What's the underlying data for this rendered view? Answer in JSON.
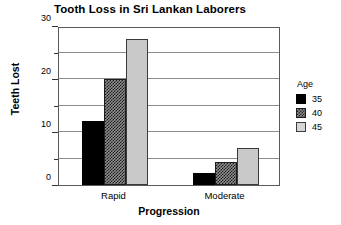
{
  "chart_data": {
    "type": "bar",
    "title": "Tooth Loss in Sri Lankan Laborers",
    "xlabel": "Progression",
    "ylabel": "Teeth Lost",
    "categories": [
      "Rapid",
      "Moderate"
    ],
    "series": [
      {
        "name": "35",
        "values": [
          12,
          2.2
        ],
        "fill": "fill-black",
        "color": "#000000"
      },
      {
        "name": "40",
        "values": [
          20,
          4.3
        ],
        "fill": "fill-hatch",
        "color": "#8f8f8f"
      },
      {
        "name": "45",
        "values": [
          27.5,
          7.0
        ],
        "fill": "fill-lightgray",
        "color": "#c9c9c9"
      }
    ],
    "ylim": [
      0,
      30
    ],
    "yticks": [
      0,
      10,
      20,
      30
    ],
    "ytick_labels": [
      "0",
      "10",
      "20",
      "30"
    ],
    "yminor": [
      5,
      15,
      25
    ],
    "gridlines": [
      5,
      10,
      15,
      20,
      25
    ],
    "grid": true,
    "legend": {
      "title": "Age",
      "position": "right",
      "entries": [
        "35",
        "40",
        "45"
      ]
    }
  }
}
